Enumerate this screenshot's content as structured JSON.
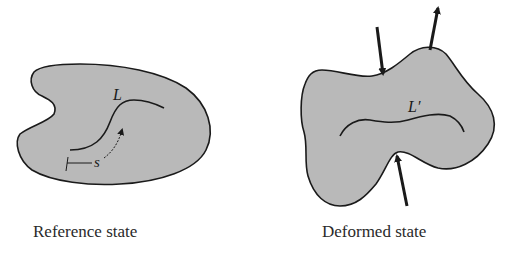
{
  "figure": {
    "panels": [
      {
        "id": "reference",
        "caption": "Reference state",
        "curve_label": "L",
        "arc_length_label": "s"
      },
      {
        "id": "deformed",
        "caption": "Deformed state",
        "curve_label": "L′",
        "force_arrows": 3
      }
    ]
  },
  "colors": {
    "body_fill": "#b9b9b9",
    "outline": "#1a1a1a",
    "background": "#ffffff",
    "text": "#2a2a2a"
  }
}
